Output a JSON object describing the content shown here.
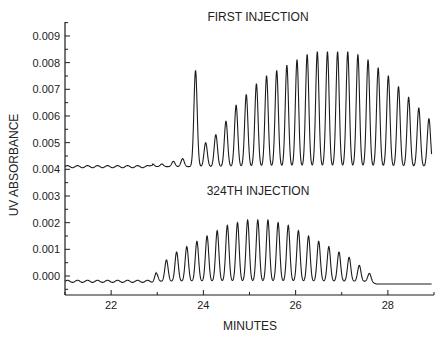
{
  "chart_data": {
    "type": "line",
    "title": "",
    "xlabel": "MINUTES",
    "ylabel": "UV ABSORBANCE",
    "xlim": [
      21.0,
      29.0
    ],
    "ylim": [
      -0.0006,
      0.0094
    ],
    "grid": false,
    "legend": null,
    "x_ticks": [
      22,
      24,
      26,
      28
    ],
    "x_tick_labels": [
      "22",
      "24",
      "26",
      "28"
    ],
    "y_ticks": [
      0.0,
      0.001,
      0.002,
      0.003,
      0.004,
      0.005,
      0.006,
      0.007,
      0.008,
      0.009
    ],
    "y_tick_labels": [
      "0.000",
      "0.001",
      "0.002",
      "0.003",
      "0.004",
      "0.005",
      "0.006",
      "0.007",
      "0.008",
      "0.009"
    ],
    "annotations": [
      {
        "text": "FIRST INJECTION",
        "x": 25.6,
        "y": 0.0097
      },
      {
        "text": "324TH INJECTION",
        "x": 25.6,
        "y": 0.0032
      }
    ],
    "series": [
      {
        "name": "FIRST INJECTION",
        "baseline": 0.0041,
        "baseline_ripple": 4e-05,
        "start_ripple_time": 21.0,
        "peak_width": 0.05,
        "peaks_time": [
          22.9,
          23.1,
          23.35,
          23.55,
          23.83,
          24.05,
          24.27,
          24.49,
          24.71,
          24.93,
          25.15,
          25.37,
          25.59,
          25.81,
          26.03,
          26.25,
          26.47,
          26.69,
          26.91,
          27.13,
          27.35,
          27.57,
          27.79,
          28.01,
          28.23,
          28.45,
          28.67,
          28.89
        ],
        "peaks_height": [
          0.0042,
          0.0042,
          0.0043,
          0.0044,
          0.0077,
          0.005,
          0.0053,
          0.0058,
          0.0064,
          0.0068,
          0.0072,
          0.0075,
          0.0077,
          0.0079,
          0.0081,
          0.0083,
          0.0084,
          0.0084,
          0.0084,
          0.0084,
          0.0083,
          0.0081,
          0.0078,
          0.0075,
          0.0071,
          0.0067,
          0.0063,
          0.0059
        ],
        "end_value": 0.0041
      },
      {
        "name": "324TH INJECTION",
        "baseline": -0.0002,
        "baseline_ripple": 4e-05,
        "peak_width": 0.05,
        "peaks_time": [
          22.98,
          23.2,
          23.42,
          23.64,
          23.86,
          24.08,
          24.3,
          24.52,
          24.74,
          24.96,
          25.18,
          25.4,
          25.62,
          25.84,
          26.06,
          26.28,
          26.5,
          26.72,
          26.94,
          27.16,
          27.38,
          27.6
        ],
        "peaks_height": [
          0.0001,
          0.0006,
          0.0009,
          0.0011,
          0.0013,
          0.0015,
          0.0017,
          0.0019,
          0.002,
          0.0021,
          0.0021,
          0.0021,
          0.002,
          0.0019,
          0.0017,
          0.0015,
          0.0013,
          0.0011,
          0.0009,
          0.0007,
          0.0004,
          0.0001
        ],
        "end_value": -0.0003
      }
    ]
  }
}
